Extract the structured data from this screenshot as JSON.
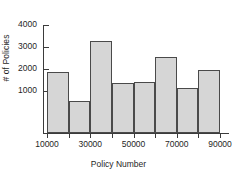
{
  "chart_data": {
    "type": "bar",
    "title": "",
    "xlabel": "Policy Number",
    "ylabel": "# of Policies",
    "categories": [
      "10000-20000",
      "20000-30000",
      "30000-40000",
      "40000-50000",
      "50000-60000",
      "60000-70000",
      "70000-80000",
      "80000-90000"
    ],
    "bin_edges": [
      10000,
      20000,
      30000,
      40000,
      50000,
      60000,
      70000,
      80000,
      90000
    ],
    "values": [
      2250,
      1200,
      3400,
      1850,
      1900,
      2800,
      1650,
      2350
    ],
    "xlim": [
      10000,
      90000
    ],
    "ylim": [
      0,
      4000
    ],
    "yticks": [
      1000,
      2000,
      3000,
      4000
    ],
    "ytick_labels": [
      "1000",
      "2000",
      "3000",
      "4000"
    ],
    "xticks": [
      10000,
      30000,
      50000,
      70000,
      90000
    ],
    "xtick_labels": [
      "10000",
      "30000",
      "50000",
      "70000",
      "90000"
    ],
    "grid": false,
    "legend": null,
    "bar_fill_color": "#d6d6d6",
    "bar_edge_color": "#4a4a4a",
    "axis_color": "#3b3b3b"
  }
}
